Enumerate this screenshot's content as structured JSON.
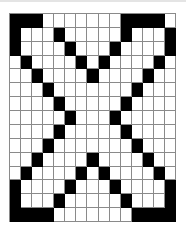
{
  "puzzle": {
    "rows": 15,
    "cols": 15,
    "colors": {
      "filled": "#000000",
      "empty": "#ffffff",
      "gridline": "#8a8a8a"
    },
    "grid": [
      "###.......####.",
      "#...#.....#...#",
      "#....#...#....#",
      ".#....#.#....#.",
      "..#....#....#..",
      "...#.......#...",
      "....#.....#....",
      ".....#...#.....",
      "....#.....#....",
      "...#.......#...",
      "..#....#....#..",
      ".#....#.#....#.",
      "#....#...#....#",
      "#...#.....#...#",
      "####.......####"
    ]
  }
}
